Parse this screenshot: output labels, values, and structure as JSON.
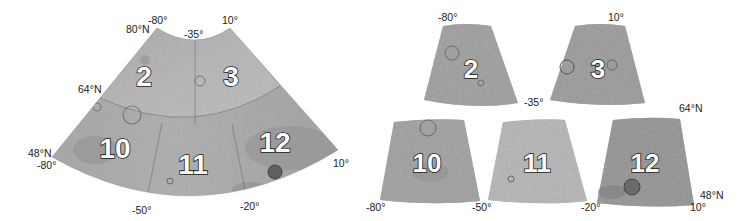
{
  "figure": {
    "left_map": {
      "lat_labels": {
        "top": "80°N",
        "middle": "64°N",
        "bottom": "48°N"
      },
      "lon_labels_top": {
        "left": "-80°",
        "center": "-35°",
        "right": "10°"
      },
      "lon_labels_bottom": {
        "left": "-80°",
        "b1": "-50°",
        "b2": "-20°",
        "right": "10°"
      },
      "quadrangles": [
        "2",
        "3",
        "10",
        "11",
        "12"
      ]
    },
    "right_map": {
      "top_labels": {
        "left": "-80°",
        "right": "10°",
        "middle": "-35°"
      },
      "lat_labels": {
        "top": "64°N",
        "bottom": "48°N"
      },
      "bottom_labels": {
        "l1": "-80°",
        "l2": "-50°",
        "l3": "-20°",
        "l4": "10°"
      },
      "tiles": [
        "2",
        "3",
        "10",
        "11",
        "12"
      ]
    }
  },
  "colors": {
    "terrain_light": "#c4c4c4",
    "terrain_mid": "#a8a8a8",
    "terrain_dark": "#8c8c8c",
    "label_text": "#222222"
  }
}
